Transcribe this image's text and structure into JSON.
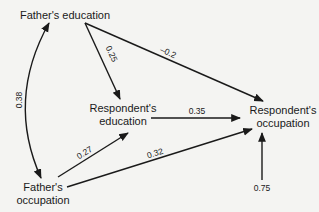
{
  "diagram": {
    "type": "path-diagram",
    "nodes": {
      "fathers_education": {
        "label": "Father's education"
      },
      "respondents_education": {
        "line1": "Respondent's",
        "line2": "education"
      },
      "respondents_occupation": {
        "line1": "Respondent's",
        "line2": "occupation"
      },
      "fathers_occupation": {
        "line1": "Father's",
        "line2": "occupation"
      }
    },
    "edges": {
      "fe_fo": {
        "from": "Father's education",
        "to": "Father's occupation",
        "type": "bidirectional-curved",
        "label": "0.38"
      },
      "fe_re": {
        "from": "Father's education",
        "to": "Respondent's education",
        "label": "0.25"
      },
      "fe_ro": {
        "from": "Father's education",
        "to": "Respondent's occupation",
        "label": "–0.2"
      },
      "re_ro": {
        "from": "Respondent's education",
        "to": "Respondent's occupation",
        "label": "0.35"
      },
      "fo_re": {
        "from": "Father's occupation",
        "to": "Respondent's education",
        "label": "0.27"
      },
      "fo_ro": {
        "from": "Father's occupation",
        "to": "Respondent's occupation",
        "label": "0.32"
      },
      "residual_ro": {
        "from": "residual",
        "to": "Respondent's occupation",
        "label": "0.75"
      }
    }
  }
}
